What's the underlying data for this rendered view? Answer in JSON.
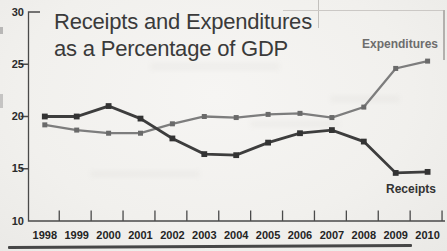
{
  "figure": {
    "title_line1": "Receipts and Expenditures",
    "title_line2": "as a Percentage of GDP"
  },
  "chart_data": {
    "type": "line",
    "title": "Receipts and Expenditures as a Percentage of GDP",
    "x": [
      1998,
      1999,
      2000,
      2001,
      2002,
      2003,
      2004,
      2005,
      2006,
      2007,
      2008,
      2009,
      2010
    ],
    "series": [
      {
        "name": "Expenditures",
        "line_color": "#7d7d7d",
        "marker_color": "#6a6a6a",
        "values": [
          19.2,
          18.7,
          18.4,
          18.4,
          19.3,
          20.0,
          19.9,
          20.2,
          20.3,
          19.9,
          20.9,
          24.6,
          25.3
        ]
      },
      {
        "name": "Receipts",
        "line_color": "#3d3d3d",
        "marker_color": "#333333",
        "values": [
          20.0,
          20.0,
          21.0,
          19.8,
          17.9,
          16.4,
          16.3,
          17.5,
          18.4,
          18.7,
          17.6,
          14.6,
          14.7
        ]
      }
    ],
    "xlabel": "",
    "ylabel": "",
    "ylim": [
      10,
      30
    ],
    "yticks": [
      10,
      15,
      20,
      25,
      30
    ],
    "grid": false,
    "legend_position": "inline-labels",
    "axis_color": "#4a4a4a"
  }
}
